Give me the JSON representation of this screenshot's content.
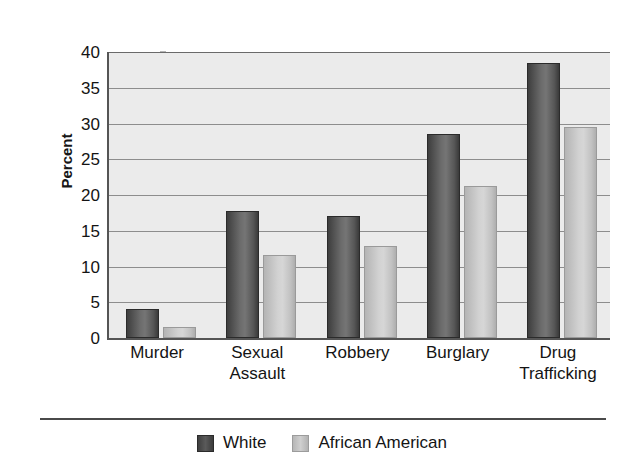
{
  "chart_data": {
    "type": "bar",
    "title": "",
    "subtitle": "",
    "xlabel": "",
    "ylabel": "Percent",
    "ylim": [
      0,
      40
    ],
    "ytick_step": 5,
    "yticks": [
      0,
      5,
      10,
      15,
      20,
      25,
      30,
      35,
      40
    ],
    "ytick_labels": [
      "0",
      "5",
      "10",
      "15",
      "20",
      "25",
      "30",
      "35",
      "40"
    ],
    "grid": true,
    "grid_axis": "y",
    "legend_position": "bottom-center",
    "categories": [
      "Murder",
      "Sexual Assault",
      "Robbery",
      "Burglary",
      "Drug Trafficking"
    ],
    "category_lines": [
      [
        "Murder"
      ],
      [
        "Sexual",
        "Assault"
      ],
      [
        "Robbery"
      ],
      [
        "Burglary"
      ],
      [
        "Drug",
        "Trafficking"
      ]
    ],
    "series": [
      {
        "name": "White",
        "color": "#4d4d4d",
        "values": [
          4.1,
          17.8,
          17.1,
          28.5,
          38.4
        ]
      },
      {
        "name": "African American",
        "color": "#c9c9c9",
        "values": [
          1.6,
          11.6,
          12.8,
          21.2,
          29.5
        ]
      }
    ],
    "annotations": []
  },
  "legend": {
    "items": [
      {
        "label": "White",
        "swatch": "white-series"
      },
      {
        "label": "African American",
        "swatch": "aa-series"
      }
    ]
  },
  "colors": {
    "plot_background": "#ebebeb",
    "gridline": "#8d8d8d",
    "axis": "#555555",
    "text": "#141414",
    "series_white": "#4d4d4d",
    "series_african_american": "#c9c9c9"
  }
}
